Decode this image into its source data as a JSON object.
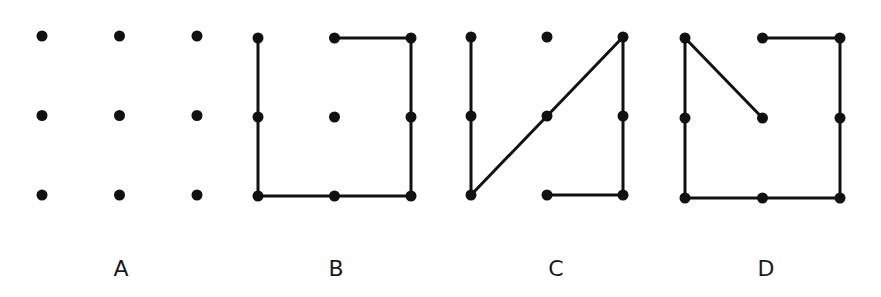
{
  "figure": {
    "grid": {
      "rows": 3,
      "cols": 3
    },
    "colors": {
      "ink": "#111111",
      "background": "#ffffff"
    },
    "panels": [
      {
        "label": "A",
        "origin": [
          42,
          36
        ],
        "spacing": [
          77.5,
          79.5
        ],
        "label_pos": [
          121,
          276
        ],
        "dots": [
          [
            0,
            0
          ],
          [
            1,
            0
          ],
          [
            2,
            0
          ],
          [
            0,
            1
          ],
          [
            1,
            1
          ],
          [
            2,
            1
          ],
          [
            0,
            2
          ],
          [
            1,
            2
          ],
          [
            2,
            2
          ]
        ],
        "segments": []
      },
      {
        "label": "B",
        "origin": [
          258,
          38
        ],
        "spacing": [
          76.5,
          79
        ],
        "label_pos": [
          336,
          276
        ],
        "dots": [
          [
            0,
            0
          ],
          [
            1,
            0
          ],
          [
            2,
            0
          ],
          [
            0,
            1
          ],
          [
            1,
            1
          ],
          [
            2,
            1
          ],
          [
            0,
            2
          ],
          [
            1,
            2
          ],
          [
            2,
            2
          ]
        ],
        "segments": [
          [
            [
              0,
              0
            ],
            [
              0,
              2
            ]
          ],
          [
            [
              0,
              2
            ],
            [
              2,
              2
            ]
          ],
          [
            [
              2,
              2
            ],
            [
              2,
              0
            ]
          ],
          [
            [
              2,
              0
            ],
            [
              1,
              0
            ]
          ]
        ]
      },
      {
        "label": "C",
        "origin": [
          471,
          37
        ],
        "spacing": [
          76,
          79
        ],
        "label_pos": [
          556,
          276
        ],
        "dots": [
          [
            0,
            0
          ],
          [
            1,
            0
          ],
          [
            2,
            0
          ],
          [
            0,
            1
          ],
          [
            1,
            1
          ],
          [
            2,
            1
          ],
          [
            0,
            2
          ],
          [
            1,
            2
          ],
          [
            2,
            2
          ]
        ],
        "segments": [
          [
            [
              0,
              0
            ],
            [
              0,
              2
            ]
          ],
          [
            [
              0,
              2
            ],
            [
              2,
              0
            ]
          ],
          [
            [
              2,
              0
            ],
            [
              2,
              2
            ]
          ],
          [
            [
              2,
              2
            ],
            [
              1,
              2
            ]
          ]
        ]
      },
      {
        "label": "D",
        "origin": [
          685,
          38
        ],
        "spacing": [
          77.5,
          80
        ],
        "label_pos": [
          766,
          276
        ],
        "dots": [
          [
            0,
            0
          ],
          [
            1,
            0
          ],
          [
            2,
            0
          ],
          [
            0,
            1
          ],
          [
            1,
            1
          ],
          [
            2,
            1
          ],
          [
            0,
            2
          ],
          [
            1,
            2
          ],
          [
            2,
            2
          ]
        ],
        "segments": [
          [
            [
              1,
              1
            ],
            [
              0,
              0
            ]
          ],
          [
            [
              0,
              0
            ],
            [
              0,
              2
            ]
          ],
          [
            [
              0,
              2
            ],
            [
              2,
              2
            ]
          ],
          [
            [
              2,
              2
            ],
            [
              2,
              0
            ]
          ],
          [
            [
              2,
              0
            ],
            [
              1,
              0
            ]
          ]
        ]
      }
    ]
  }
}
